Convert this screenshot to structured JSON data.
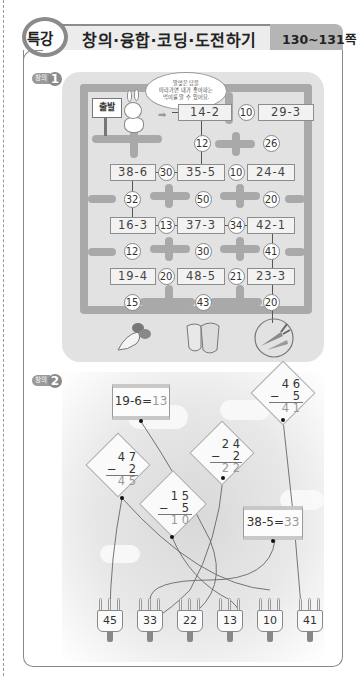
{
  "header": {
    "badge": "특강",
    "title": "창의·융합·코딩·도전하기",
    "pages": "130~131쪽"
  },
  "problem1": {
    "badge_label": "창의",
    "badge_number": "1",
    "sign": "출발",
    "speech_bubble": [
      "알맞은 답을",
      "따라가면 내가 좋아하는",
      "먹이를 알 수 있어요."
    ],
    "rows": [
      {
        "boxes": [
          "14-2",
          "29-3"
        ],
        "circles": [
          "10"
        ]
      },
      {
        "circles": [
          "12",
          "26"
        ]
      },
      {
        "boxes": [
          "38-6",
          "35-5",
          "24-4"
        ],
        "circles": [
          "30",
          "10"
        ]
      },
      {
        "circles": [
          "32",
          "50",
          "20"
        ]
      },
      {
        "boxes": [
          "16-3",
          "37-3",
          "42-1"
        ],
        "circles": [
          "13",
          "34"
        ]
      },
      {
        "circles": [
          "12",
          "30",
          "41"
        ]
      },
      {
        "boxes": [
          "19-4",
          "48-5",
          "23-3"
        ],
        "circles": [
          "20",
          "21"
        ]
      },
      {
        "circles": [
          "15",
          "43",
          "20"
        ]
      }
    ],
    "foods": [
      "radish-icon",
      "cabbage-icon",
      "carrot-icon"
    ],
    "answer_food": "carrot-icon"
  },
  "problem2": {
    "badge_label": "창의",
    "badge_number": "2",
    "box_kites": [
      {
        "expr": "19-6=",
        "answer": "13"
      },
      {
        "expr": "38-5=",
        "answer": "33"
      }
    ],
    "diamond_kites": [
      {
        "top": "4 7",
        "sub": "2",
        "answer": "4 5"
      },
      {
        "top": "2 4",
        "sub": "2",
        "answer": "2 2"
      },
      {
        "top": "4 6",
        "sub": "5",
        "answer": "4 1"
      },
      {
        "top": "1 5",
        "sub": "5",
        "answer": "1 0"
      }
    ],
    "minus": "−",
    "spools": [
      "45",
      "33",
      "22",
      "13",
      "10",
      "41"
    ]
  }
}
